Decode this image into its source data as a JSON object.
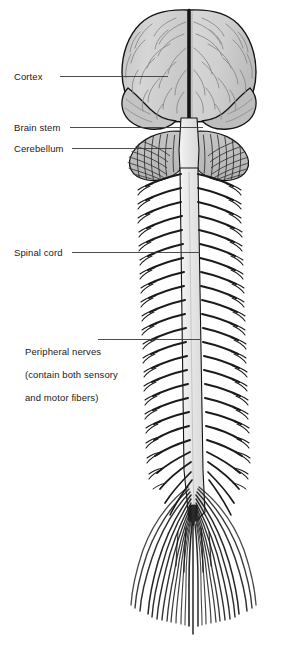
{
  "figure": {
    "background": "#ffffff",
    "colors": {
      "cerebrum_fill": "#d2d2d2",
      "cerebrum_shade": "#bdbdbd",
      "cerebellum_fill": "#c9c9c9",
      "brainstem_fill": "#e6e6e6",
      "spinal_cord_fill": "#e8e8e8",
      "nerve_stroke": "#1a1a1a",
      "outline": "#141414",
      "sulci": "#8a8a8a",
      "label_text": "#1a1a1a",
      "leader_line": "#3a3a3a"
    }
  },
  "labels": [
    {
      "id": "cortex",
      "name": "Cortex",
      "lines": [
        "Cortex"
      ],
      "x": 14,
      "y": 71,
      "leader": {
        "x1": 60,
        "y1": 76,
        "x2": 168,
        "y2": 76
      }
    },
    {
      "id": "brain-stem",
      "name": "Brain stem",
      "lines": [
        "Brain stem"
      ],
      "x": 14,
      "y": 122,
      "leader": {
        "x1": 70,
        "y1": 127,
        "x2": 203,
        "y2": 127
      }
    },
    {
      "id": "cerebellum",
      "name": "Cerebellum",
      "lines": [
        "Cerebellum"
      ],
      "x": 14,
      "y": 143,
      "leader": {
        "x1": 72,
        "y1": 148,
        "x2": 172,
        "y2": 148
      }
    },
    {
      "id": "spinal-cord",
      "name": "Spinal cord",
      "lines": [
        "Spinal cord"
      ],
      "x": 14,
      "y": 247,
      "leader": {
        "x1": 72,
        "y1": 252,
        "x2": 200,
        "y2": 252
      }
    },
    {
      "id": "peripheral-nerves",
      "name": "Peripheral nerves",
      "lines": [
        "Peripheral nerves",
        "(contain both sensory",
        "and motor fibers)"
      ],
      "x": 14,
      "y": 334,
      "leader": {
        "x1": 98,
        "y1": 339,
        "x2": 200,
        "y2": 339
      }
    }
  ],
  "structures": {
    "cerebrum": "cerebral hemispheres with gyri and sulci",
    "longitudinal_fissure": "midline fissure separating hemispheres",
    "temporal_lobe": "lateral lower lobes",
    "cerebellum": "folia striations below occipital lobes",
    "brain_stem": "medulla continuing into spinal cord",
    "spinal_cord": "vertical cord descending to conus medullaris",
    "spinal_nerves": "31 paired nerve roots branching laterally",
    "cauda_equina": "fanning filaments below conus medullaris"
  },
  "counts": {
    "paired_spinal_nerves": 24,
    "cauda_equina_filaments": 26
  }
}
